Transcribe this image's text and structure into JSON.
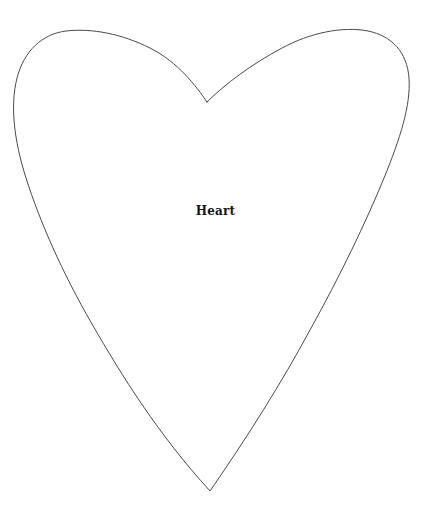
{
  "page": {
    "background_color": "#ffffff",
    "width": 431,
    "height": 509,
    "title": "Heart"
  },
  "figure": {
    "name": "heart",
    "label": "Heart",
    "label_color": "#141414",
    "label_font_size": 12,
    "label_bold": true,
    "label_center": {
      "x": 213,
      "y": 212
    },
    "outline_color": "#4a4a4a",
    "outline_width": 1,
    "fill": "none",
    "bounding_box": {
      "left": 15,
      "top": 30,
      "right": 411,
      "bottom": 492
    },
    "key_points": {
      "top_cleft": {
        "x": 207,
        "y": 102
      },
      "bottom_tip": {
        "x": 210,
        "y": 491
      },
      "left_lobe_peak": {
        "x": 62,
        "y": 31
      },
      "right_lobe_peak": {
        "x": 358,
        "y": 31
      },
      "left_extremity": {
        "x": 15,
        "y": 110
      },
      "right_extremity": {
        "x": 410,
        "y": 86
      }
    },
    "path": "M 207 102 C 196 86 178 62 150 48 C 122 34 92 28 66 31 C 42 34 24 51 17 78 C 10 106 14 140 26 178 C 40 222 62 272 92 324 C 122 376 158 434 210 491 C 248 436 282 382 310 330 C 340 276 366 222 384 178 C 400 139 411 105 409 78 C 407 52 392 36 368 31 C 342 26 310 33 282 48 C 252 64 225 84 207 102 Z"
  }
}
